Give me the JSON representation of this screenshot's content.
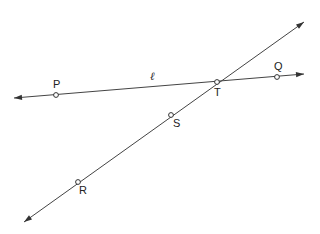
{
  "diagram": {
    "type": "geometry",
    "lines": [
      {
        "name": "line-l",
        "label": "ℓ",
        "label_pos": [
          150,
          80
        ],
        "from": [
          14,
          98
        ],
        "to": [
          304,
          74
        ],
        "arrows": "both",
        "points_on": [
          "P",
          "T",
          "Q"
        ]
      },
      {
        "name": "transversal",
        "label": "",
        "from": [
          24,
          222
        ],
        "to": [
          304,
          22
        ],
        "arrows": "both",
        "points_on": [
          "R",
          "S",
          "T"
        ]
      }
    ],
    "points": [
      {
        "id": "P",
        "label": "P",
        "x": 56,
        "y": 95,
        "label_x": 53,
        "label_y": 88
      },
      {
        "id": "Q",
        "label": "Q",
        "x": 277,
        "y": 77,
        "label_x": 274,
        "label_y": 70
      },
      {
        "id": "T",
        "label": "T",
        "x": 217,
        "y": 82,
        "label_x": 214,
        "label_y": 96
      },
      {
        "id": "S",
        "label": "S",
        "x": 171,
        "y": 115,
        "label_x": 173,
        "label_y": 127
      },
      {
        "id": "R",
        "label": "R",
        "x": 78,
        "y": 182,
        "label_x": 79,
        "label_y": 194
      }
    ],
    "colors": {
      "stroke": "#444444",
      "background": "#ffffff"
    }
  }
}
